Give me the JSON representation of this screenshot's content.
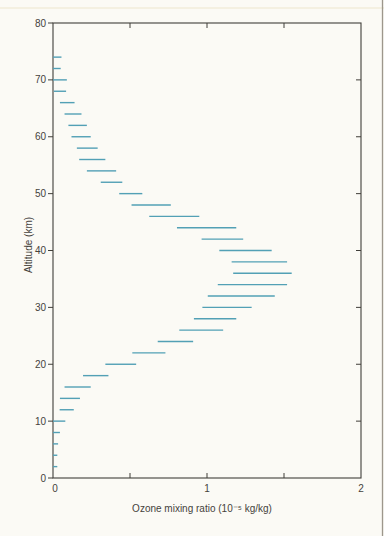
{
  "page": {
    "background": "#fbfaf5",
    "right_edge_line_color": "#9d978c",
    "top_scan_band_color": "#f3eddc"
  },
  "chart_data": {
    "type": "line",
    "style": "horizontal-segment-profile",
    "title": "",
    "xlabel": "Ozone mixing ratio (10⁻⁵ kg/kg)",
    "ylabel": "Altitude (km)",
    "xlim": [
      0,
      2
    ],
    "ylim": [
      0,
      80
    ],
    "grid": false,
    "legend_position": "none",
    "x_tick_labels": [
      "0",
      "1",
      "2"
    ],
    "x_tick_values": [
      0,
      1,
      2
    ],
    "x_minor_ticks": [
      0.5,
      1.0,
      1.5
    ],
    "y_tick_labels": [
      "0",
      "10",
      "20",
      "30",
      "40",
      "50",
      "60",
      "70",
      "80"
    ],
    "y_tick_values": [
      0,
      10,
      20,
      30,
      40,
      50,
      60,
      70,
      80
    ],
    "right_axis_ticks": [
      10,
      20,
      30,
      40,
      50,
      60,
      70
    ],
    "top_axis_ticks": [
      0.5,
      1.0,
      1.5
    ],
    "line_color": "#52a0b5",
    "axis_color": "#403e39",
    "label_color": "#45423c",
    "segments": [
      {
        "altitude_km": 74,
        "from": 0.0,
        "to": 0.055
      },
      {
        "altitude_km": 72,
        "from": 0.0,
        "to": 0.05
      },
      {
        "altitude_km": 70,
        "from": 0.0,
        "to": 0.09
      },
      {
        "altitude_km": 68,
        "from": 0.005,
        "to": 0.085
      },
      {
        "altitude_km": 66,
        "from": 0.045,
        "to": 0.14
      },
      {
        "altitude_km": 64,
        "from": 0.075,
        "to": 0.185
      },
      {
        "altitude_km": 62,
        "from": 0.1,
        "to": 0.22
      },
      {
        "altitude_km": 60,
        "from": 0.12,
        "to": 0.245
      },
      {
        "altitude_km": 58,
        "from": 0.155,
        "to": 0.29
      },
      {
        "altitude_km": 56,
        "from": 0.17,
        "to": 0.34
      },
      {
        "altitude_km": 54,
        "from": 0.22,
        "to": 0.41
      },
      {
        "altitude_km": 52,
        "from": 0.31,
        "to": 0.45
      },
      {
        "altitude_km": 50,
        "from": 0.43,
        "to": 0.58
      },
      {
        "altitude_km": 48,
        "from": 0.51,
        "to": 0.765
      },
      {
        "altitude_km": 46,
        "from": 0.625,
        "to": 0.95
      },
      {
        "altitude_km": 44,
        "from": 0.805,
        "to": 1.19
      },
      {
        "altitude_km": 42,
        "from": 0.965,
        "to": 1.235
      },
      {
        "altitude_km": 40,
        "from": 1.08,
        "to": 1.42
      },
      {
        "altitude_km": 38,
        "from": 1.16,
        "to": 1.52
      },
      {
        "altitude_km": 36,
        "from": 1.17,
        "to": 1.55
      },
      {
        "altitude_km": 34,
        "from": 1.07,
        "to": 1.52
      },
      {
        "altitude_km": 32,
        "from": 1.005,
        "to": 1.44
      },
      {
        "altitude_km": 30,
        "from": 0.97,
        "to": 1.29
      },
      {
        "altitude_km": 28,
        "from": 0.915,
        "to": 1.19
      },
      {
        "altitude_km": 26,
        "from": 0.82,
        "to": 1.105
      },
      {
        "altitude_km": 24,
        "from": 0.68,
        "to": 0.91
      },
      {
        "altitude_km": 22,
        "from": 0.515,
        "to": 0.73
      },
      {
        "altitude_km": 20,
        "from": 0.34,
        "to": 0.54
      },
      {
        "altitude_km": 18,
        "from": 0.195,
        "to": 0.36
      },
      {
        "altitude_km": 16,
        "from": 0.075,
        "to": 0.245
      },
      {
        "altitude_km": 14,
        "from": 0.045,
        "to": 0.175
      },
      {
        "altitude_km": 12,
        "from": 0.043,
        "to": 0.135
      },
      {
        "altitude_km": 10,
        "from": 0.0,
        "to": 0.08
      },
      {
        "altitude_km": 8,
        "from": 0.0,
        "to": 0.045
      },
      {
        "altitude_km": 6,
        "from": 0.0,
        "to": 0.033
      },
      {
        "altitude_km": 4,
        "from": 0.0,
        "to": 0.028
      },
      {
        "altitude_km": 2,
        "from": 0.0,
        "to": 0.028
      }
    ]
  }
}
